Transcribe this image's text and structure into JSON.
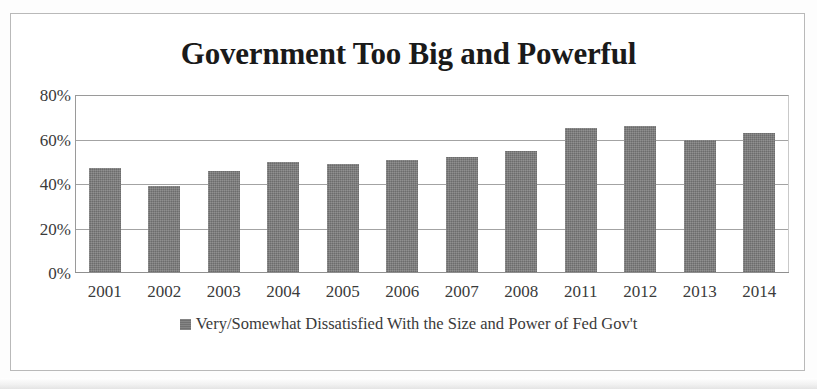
{
  "chart_data": {
    "type": "bar",
    "title": "Government Too Big and Powerful",
    "xlabel": "",
    "ylabel": "",
    "ylim": [
      0,
      80
    ],
    "ytick_labels": [
      "80%",
      "60%",
      "40%",
      "20%",
      "0%"
    ],
    "ytick_values": [
      80,
      60,
      40,
      20,
      0
    ],
    "grid": true,
    "legend_position": "bottom",
    "categories": [
      "2001",
      "2002",
      "2003",
      "2004",
      "2005",
      "2006",
      "2007",
      "2008",
      "2011",
      "2012",
      "2013",
      "2014"
    ],
    "series": [
      {
        "name": "Very/Somewhat Dissatisfied With the Size and Power of Fed Gov't",
        "color": "#777777",
        "values": [
          47,
          39,
          46,
          50,
          49,
          51,
          52,
          55,
          65,
          66,
          60,
          63
        ]
      }
    ]
  },
  "legend": {
    "swatch_icon": "legend-square-icon",
    "label": "Very/Somewhat Dissatisfied With the Size and Power of Fed Gov't"
  }
}
